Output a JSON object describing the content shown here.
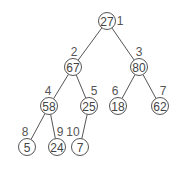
{
  "diagram": {
    "type": "binary-tree",
    "stroke_color": "#555555",
    "text_color": "#444444",
    "nodes": [
      {
        "index": "1",
        "value": "27",
        "x": 107,
        "y": 21,
        "lx": 120,
        "ly": 25
      },
      {
        "index": "2",
        "value": "67",
        "x": 73,
        "y": 67,
        "lx": 74,
        "ly": 56
      },
      {
        "index": "3",
        "value": "80",
        "x": 139,
        "y": 67,
        "lx": 139,
        "ly": 56
      },
      {
        "index": "4",
        "value": "58",
        "x": 49,
        "y": 106,
        "lx": 48,
        "ly": 95
      },
      {
        "index": "5",
        "value": "25",
        "x": 89,
        "y": 106,
        "lx": 94,
        "ly": 95
      },
      {
        "index": "6",
        "value": "18",
        "x": 118,
        "y": 106,
        "lx": 115,
        "ly": 95
      },
      {
        "index": "7",
        "value": "62",
        "x": 160,
        "y": 106,
        "lx": 163,
        "ly": 95
      },
      {
        "index": "8",
        "value": "5",
        "x": 27,
        "y": 147,
        "lx": 25,
        "ly": 136
      },
      {
        "index": "9",
        "value": "24",
        "x": 57,
        "y": 147,
        "lx": 60,
        "ly": 136
      },
      {
        "index": "10",
        "value": "7",
        "x": 80,
        "y": 147,
        "lx": 73,
        "ly": 136
      }
    ],
    "edges": [
      {
        "from": 0,
        "to": 1
      },
      {
        "from": 0,
        "to": 2
      },
      {
        "from": 1,
        "to": 3
      },
      {
        "from": 1,
        "to": 4
      },
      {
        "from": 2,
        "to": 5
      },
      {
        "from": 2,
        "to": 6
      },
      {
        "from": 3,
        "to": 7
      },
      {
        "from": 3,
        "to": 8
      },
      {
        "from": 4,
        "to": 9
      }
    ]
  }
}
